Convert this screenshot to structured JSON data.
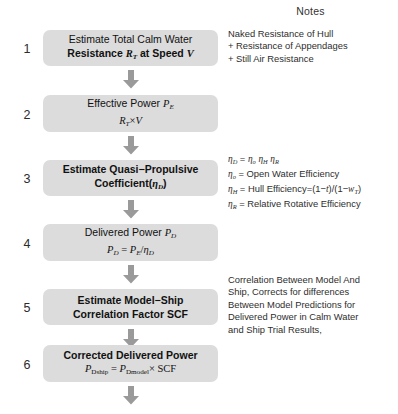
{
  "notes_header": "Notes",
  "steps": [
    {
      "number": "1",
      "line1": "Estimate Total Calm Water",
      "line2_a": "Resistance ",
      "line2_sym": "R",
      "line2_sub": "T",
      "line2_b": " at Speed ",
      "line2_sym2": "V"
    },
    {
      "number": "2",
      "line1_a": "Effective Power ",
      "line1_sym": "P",
      "line1_sub": "E",
      "line2_sym": "R",
      "line2_sub": "T",
      "line2_op": "×",
      "line2_sym2": "V"
    },
    {
      "number": "3",
      "line1": "Estimate Quasi−Propulsive",
      "line2_a": "Coefficient(",
      "line2_eta": "η",
      "line2_sub": "D",
      "line2_b": ")"
    },
    {
      "number": "4",
      "line1_a": "Delivered Power ",
      "line1_sym": "P",
      "line1_sub": "D",
      "line2_sym": "P",
      "line2_sub": "D",
      "line2_eq": " = ",
      "line2_sym2": "P",
      "line2_sub2": "E",
      "line2_slash": "/",
      "line2_eta": "η",
      "line2_sub3": "D"
    },
    {
      "number": "5",
      "line1": "Estimate Model−Ship",
      "line2": "Correlation Factor SCF"
    },
    {
      "number": "6",
      "line1": "Corrected Delivered Power",
      "line2_sym": "P",
      "line2_sub": "Dship",
      "line2_eq": " = ",
      "line2_sym2": "P",
      "line2_sub2": "Dmodel",
      "line2_op": "× SCF"
    }
  ],
  "notes": {
    "step1": [
      "Naked Resistance of Hull",
      "+ Resistance of Appendages",
      "+ Still Air Resistance"
    ],
    "step3": {
      "l1_eta": "η",
      "l1_sub": "D",
      "l1_eq": " = ",
      "l1_eta2": "η",
      "l1_sub2": "o",
      "l1_eta3": "η",
      "l1_sub3": "H",
      "l1_eta4": "η",
      "l1_sub4": "R",
      "l2_eta": "η",
      "l2_sub": "o",
      "l2_text": " = Open Water Efficiency",
      "l3_eta": "η",
      "l3_sub": "H",
      "l3_text_a": " = Hull Efficiency=(1−",
      "l3_t": "t",
      "l3_text_b": ")/(1−",
      "l3_w": "w",
      "l3_wsub": "T",
      "l3_text_c": ")",
      "l4_eta": "η",
      "l4_sub": "R",
      "l4_text": " = Relative Rotative Efficiency"
    },
    "step5": [
      "Correlation Between Model And",
      "Ship, Corrects for differences",
      "Between Model Predictions for",
      "Delivered Power in Calm Water",
      "and Ship Trial Results,"
    ]
  },
  "colors": {
    "box_fill": "#dcdcdc",
    "arrow_fill": "#9a9a9a",
    "text": "#111111",
    "note_text": "#2e2e2e"
  }
}
